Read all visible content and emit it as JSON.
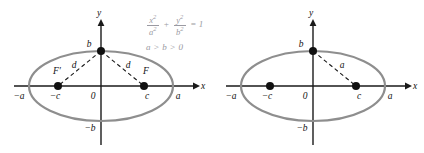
{
  "figure": {
    "background_color": "#ffffff",
    "ellipse_color": "#8e8e8e",
    "axis_color": "#1a1a1a",
    "equation_color": "#9a9aa2"
  },
  "left_panel": {
    "name": "ellipse-with-two-foci",
    "equation": {
      "x_numerator": "x",
      "x_denominator": "a",
      "y_numerator": "y",
      "y_denominator": "b",
      "plus": "+",
      "equals": "= 1",
      "exponent": "2",
      "condition": "a > b > 0"
    },
    "axes": {
      "x_label": "x",
      "y_label": "y",
      "origin_label": "0"
    },
    "labels": {
      "vertex_top": "b",
      "vertex_bottom": "−b",
      "vertex_left": "−a",
      "vertex_right": "a",
      "focus_left": "F′",
      "focus_right": "F",
      "focus_left_coord": "−c",
      "focus_right_coord": "c",
      "distance_left": "d",
      "distance_right": "d"
    },
    "geometry": {
      "center_x": 101,
      "center_y": 86,
      "semi_major": 72,
      "semi_minor": 35,
      "focus_left_x": 58,
      "focus_right_x": 144,
      "vertex_top_y": 51
    }
  },
  "right_panel": {
    "name": "ellipse-with-relation",
    "equation": {
      "text": "a² = b² + c²",
      "a": "a",
      "b": "b",
      "c": "c",
      "exponent": "2",
      "equals": "=",
      "plus": "+"
    },
    "axes": {
      "x_label": "x",
      "y_label": "y",
      "origin_label": "0"
    },
    "labels": {
      "vertex_top": "b",
      "vertex_bottom": "−b",
      "vertex_left": "−a",
      "vertex_right": "a",
      "focus_left_coord": "−c",
      "focus_right_coord": "c",
      "distance": "a"
    },
    "geometry": {
      "center_x": 101,
      "center_y": 86,
      "semi_major": 72,
      "semi_minor": 35,
      "focus_left_x": 58,
      "focus_right_x": 144,
      "vertex_top_y": 51
    }
  }
}
